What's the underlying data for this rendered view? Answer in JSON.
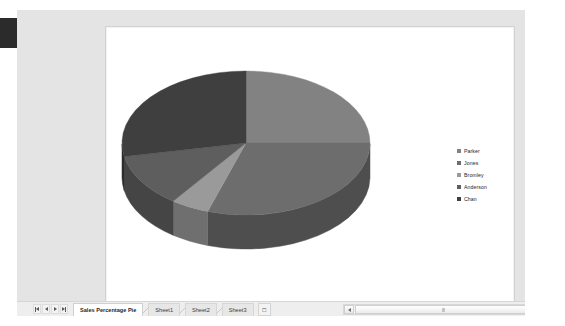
{
  "window": {
    "active_sheet_name": "Sales Percentage Pie"
  },
  "chart_data": {
    "type": "pie",
    "title": "",
    "subtitle": "",
    "xlabel": "",
    "ylabel": "",
    "three_d": true,
    "grid": false,
    "legend_position": "right",
    "categories": [
      "Parker",
      "Jones",
      "Bromley",
      "Anderson",
      "Chan"
    ],
    "values": [
      25,
      30,
      5,
      12,
      28
    ],
    "labels_shown": false,
    "colors": [
      "#828282",
      "#6d6d6d",
      "#9a9a9a",
      "#5e5e5e",
      "#3f3f3f"
    ],
    "side_colors": [
      "#5d5d5d",
      "#4e4e4e",
      "#6f6f6f",
      "#454545",
      "#2d2d2d"
    ],
    "annotations": []
  },
  "legend": {
    "items": [
      {
        "label": "Parker",
        "color": "#828282"
      },
      {
        "label": "Jones",
        "color": "#6d6d6d"
      },
      {
        "label": "Bromley",
        "color": "#9a9a9a"
      },
      {
        "label": "Anderson",
        "color": "#5e5e5e"
      },
      {
        "label": "Chan",
        "color": "#3f3f3f"
      }
    ]
  },
  "tab_bar": {
    "nav_buttons": [
      {
        "name": "first-sheet",
        "icon": "first-arrow-icon"
      },
      {
        "name": "previous-sheet",
        "icon": "prev-arrow-icon"
      },
      {
        "name": "next-sheet",
        "icon": "next-arrow-icon"
      },
      {
        "name": "last-sheet",
        "icon": "last-arrow-icon"
      }
    ],
    "tabs": [
      {
        "label": "Sales Percentage Pie",
        "active": true
      },
      {
        "label": "Sheet1",
        "active": false
      },
      {
        "label": "Sheet2",
        "active": false
      },
      {
        "label": "Sheet3",
        "active": false
      }
    ],
    "insert_sheet_icon": "insert-sheet-icon"
  },
  "scrollbars": {
    "vertical": {
      "up_icon": "scroll-up-arrow-icon",
      "down_icon": "scroll-down-arrow-icon"
    },
    "horizontal": {
      "left_icon": "scroll-left-arrow-icon",
      "right_icon": "scroll-right-arrow-icon"
    }
  }
}
